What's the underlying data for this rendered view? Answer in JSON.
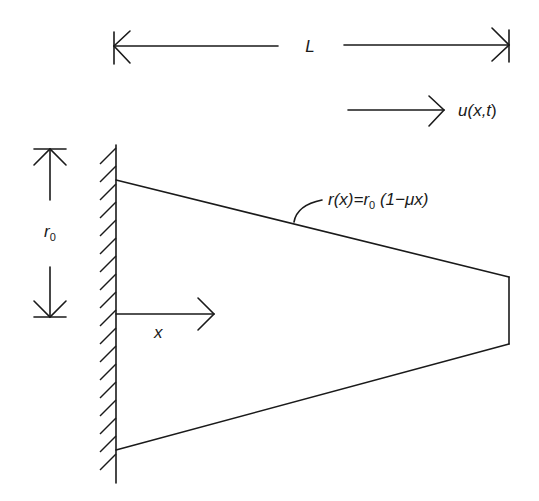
{
  "diagram": {
    "colors": {
      "ink": "#1a1a1a",
      "background": "#ffffff"
    },
    "labels": {
      "length": "L",
      "displacement_base": "u(",
      "displacement_var": "x,t",
      "displacement_end": ")",
      "radius_root_r": "r",
      "radius_root_sub": "0",
      "radius_fn_r": "r",
      "radius_fn_x": "(x)=",
      "radius_fn_r0": "r",
      "radius_fn_sub": "0",
      "radius_fn_rest": " (1−μx)",
      "axis_x": "x"
    },
    "elements": [
      "fixed-wall-hatched",
      "tapered-bar-trapezoid",
      "length-dimension-L",
      "displacement-arrow-u",
      "root-radius-dimension-r0",
      "x-axis-arrow",
      "radius-function-leader"
    ]
  }
}
